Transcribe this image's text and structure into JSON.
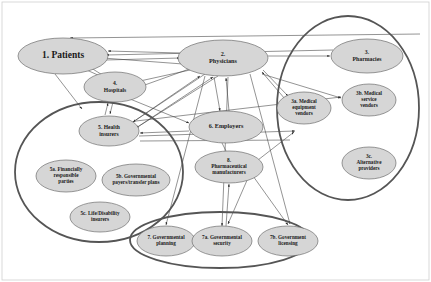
{
  "diagram": {
    "colors": {
      "node_fill": "#d6d6d6",
      "node_stroke": "#6e6e6e",
      "cluster_stroke": "#555555",
      "edge_stroke": "#3b3b3b",
      "background": "#ffffff",
      "frame_stroke": "#cfcfcf"
    },
    "clusters": [
      {
        "id": "cluster-insurers",
        "cx": 99,
        "cy": 172,
        "rx": 84,
        "ry": 70
      },
      {
        "id": "cluster-vendors",
        "cx": 348,
        "cy": 108,
        "rx": 71,
        "ry": 92
      },
      {
        "id": "cluster-government",
        "cx": 220,
        "cy": 240,
        "rx": 90,
        "ry": 28
      }
    ],
    "nodes": [
      {
        "id": "patients",
        "label_lines": [
          "1. Patients"
        ],
        "cx": 63,
        "cy": 56,
        "rx": 45,
        "ry": 18,
        "font_size": 9.5,
        "bold": true
      },
      {
        "id": "physicians",
        "label_lines": [
          "2.",
          "Physicians"
        ],
        "cx": 223,
        "cy": 58,
        "rx": 45,
        "ry": 18,
        "font_size": 6.2,
        "bold": true
      },
      {
        "id": "pharmacies",
        "label_lines": [
          "3.",
          "Pharmacies"
        ],
        "cx": 367,
        "cy": 56,
        "rx": 36,
        "ry": 17,
        "font_size": 5.8,
        "bold": true
      },
      {
        "id": "hospitals",
        "label_lines": [
          "4.",
          "Hospitals"
        ],
        "cx": 115,
        "cy": 87,
        "rx": 31,
        "ry": 15,
        "font_size": 5.6,
        "bold": true
      },
      {
        "id": "health-insurers",
        "label_lines": [
          "5. Health",
          "insurers"
        ],
        "cx": 109,
        "cy": 131,
        "rx": 30,
        "ry": 15,
        "font_size": 5.6,
        "bold": true
      },
      {
        "id": "employers",
        "label_lines": [
          "6. Employers"
        ],
        "cx": 226,
        "cy": 127,
        "rx": 37,
        "ry": 16,
        "font_size": 6.2,
        "bold": true
      },
      {
        "id": "pharma-manufacturers",
        "label_lines": [
          "8.",
          "Pharmaceutical",
          "manufacturers"
        ],
        "cx": 229,
        "cy": 167,
        "rx": 34,
        "ry": 16,
        "font_size": 5.3,
        "bold": true
      },
      {
        "id": "medical-equipment-vendors",
        "label_lines": [
          "3a. Medical",
          "equipment",
          "vendors"
        ],
        "cx": 304,
        "cy": 108,
        "rx": 27,
        "ry": 16,
        "font_size": 5.2,
        "bold": true
      },
      {
        "id": "medical-service-vendors",
        "label_lines": [
          "3b. Medical",
          "service",
          "vendors"
        ],
        "cx": 369,
        "cy": 100,
        "rx": 27,
        "ry": 16,
        "font_size": 5.2,
        "bold": true
      },
      {
        "id": "alternative-providers",
        "label_lines": [
          "3c.",
          "Alternative",
          "providers"
        ],
        "cx": 369,
        "cy": 163,
        "rx": 27,
        "ry": 16,
        "font_size": 5.2,
        "bold": true
      },
      {
        "id": "financially-responsible-parties",
        "label_lines": [
          "5a. Financially",
          "responsible",
          "parties"
        ],
        "cx": 66,
        "cy": 176,
        "rx": 30,
        "ry": 16,
        "font_size": 5.2,
        "bold": true
      },
      {
        "id": "governmental-payers",
        "label_lines": [
          "5b. Governmental",
          "payers/transfer plans"
        ],
        "cx": 136,
        "cy": 180,
        "rx": 34,
        "ry": 16,
        "font_size": 5.2,
        "bold": true
      },
      {
        "id": "life-disability-insurers",
        "label_lines": [
          "5c. Life/Disability",
          "insurers"
        ],
        "cx": 100,
        "cy": 217,
        "rx": 30,
        "ry": 15,
        "font_size": 5.2,
        "bold": true
      },
      {
        "id": "governmental-planning",
        "label_lines": [
          "7. Governmental",
          "planning"
        ],
        "cx": 166,
        "cy": 241,
        "rx": 29,
        "ry": 15,
        "font_size": 5.2,
        "bold": true
      },
      {
        "id": "governmental-security",
        "label_lines": [
          "7a. Governmental",
          "security"
        ],
        "cx": 222,
        "cy": 241,
        "rx": 30,
        "ry": 15,
        "font_size": 5.2,
        "bold": true
      },
      {
        "id": "governmental-licensing",
        "label_lines": [
          "7b. Government",
          "licensing"
        ],
        "cx": 288,
        "cy": 241,
        "rx": 30,
        "ry": 15,
        "font_size": 5.2,
        "bold": true
      }
    ],
    "edges": [
      {
        "id": "edge-patients-physicians-top",
        "x1": 70,
        "y1": 38,
        "x2": 420,
        "y2": 34,
        "arrow": "start"
      },
      {
        "id": "edge-physicians-patients-1",
        "x1": 180,
        "y1": 53,
        "x2": 108,
        "y2": 51,
        "arrow": "end"
      },
      {
        "id": "edge-physicians-patients-2",
        "x1": 183,
        "y1": 64,
        "x2": 103,
        "y2": 58,
        "arrow": "end"
      },
      {
        "id": "edge-pharmacies-patients",
        "x1": 333,
        "y1": 50,
        "x2": 106,
        "y2": 55,
        "arrow": "end"
      },
      {
        "id": "edge-patients-physicians-mid",
        "x1": 106,
        "y1": 60,
        "x2": 180,
        "y2": 58,
        "arrow": "end"
      },
      {
        "id": "edge-hospitals-patients",
        "x1": 100,
        "y1": 76,
        "x2": 80,
        "y2": 67,
        "arrow": "end"
      },
      {
        "id": "edge-patients-hospitals",
        "x1": 88,
        "y1": 66,
        "x2": 104,
        "y2": 76,
        "arrow": "end"
      },
      {
        "id": "edge-patients-insurers-left",
        "x1": 55,
        "y1": 74,
        "x2": 82,
        "y2": 109,
        "arrow": "end"
      },
      {
        "id": "edge-hospitals-insurers",
        "x1": 113,
        "y1": 102,
        "x2": 110,
        "y2": 114,
        "arrow": "end"
      },
      {
        "id": "edge-insurers-hospitals",
        "x1": 105,
        "y1": 115,
        "x2": 108,
        "y2": 103,
        "arrow": "end"
      },
      {
        "id": "edge-physicians-hospitals",
        "x1": 190,
        "y1": 70,
        "x2": 140,
        "y2": 81,
        "arrow": "end"
      },
      {
        "id": "edge-hospitals-physicians",
        "x1": 142,
        "y1": 86,
        "x2": 192,
        "y2": 68,
        "arrow": "end"
      },
      {
        "id": "edge-insurers-physicians-1",
        "x1": 130,
        "y1": 124,
        "x2": 200,
        "y2": 76,
        "arrow": "end"
      },
      {
        "id": "edge-insurers-physicians-2",
        "x1": 133,
        "y1": 130,
        "x2": 213,
        "y2": 77,
        "arrow": "end"
      },
      {
        "id": "edge-physicians-insurers-1",
        "x1": 205,
        "y1": 74,
        "x2": 133,
        "y2": 122,
        "arrow": "end"
      },
      {
        "id": "edge-physicians-insurers-2",
        "x1": 218,
        "y1": 76,
        "x2": 136,
        "y2": 128,
        "arrow": "end"
      },
      {
        "id": "edge-employers-insurers",
        "x1": 189,
        "y1": 131,
        "x2": 140,
        "y2": 133,
        "arrow": "end"
      },
      {
        "id": "edge-insurers-employers",
        "x1": 140,
        "y1": 141,
        "x2": 290,
        "y2": 140,
        "arrow": "none"
      },
      {
        "id": "edge-physicians-employers",
        "x1": 214,
        "y1": 77,
        "x2": 220,
        "y2": 111,
        "arrow": "end"
      },
      {
        "id": "edge-employers-physicians",
        "x1": 229,
        "y1": 111,
        "x2": 226,
        "y2": 78,
        "arrow": "end"
      },
      {
        "id": "edge-patients-employers",
        "x1": 108,
        "y1": 90,
        "x2": 189,
        "y2": 123,
        "arrow": "end"
      },
      {
        "id": "edge-employers-pharma",
        "x1": 222,
        "y1": 143,
        "x2": 226,
        "y2": 151,
        "arrow": "none"
      },
      {
        "id": "edge-physicians-pharmacies",
        "x1": 268,
        "y1": 56,
        "x2": 330,
        "y2": 56,
        "arrow": "end"
      },
      {
        "id": "edge-physicians-equipment",
        "x1": 263,
        "y1": 70,
        "x2": 288,
        "y2": 96,
        "arrow": "end"
      },
      {
        "id": "edge-physicians-servicevendors",
        "x1": 262,
        "y1": 74,
        "x2": 341,
        "y2": 98,
        "arrow": "end"
      },
      {
        "id": "edge-insurers-servicevendors",
        "x1": 136,
        "y1": 121,
        "x2": 341,
        "y2": 97,
        "arrow": "end"
      },
      {
        "id": "edge-pharma-vendors",
        "x1": 258,
        "y1": 160,
        "x2": 294,
        "y2": 132,
        "arrow": "end"
      },
      {
        "id": "edge-insurers-vendors-low",
        "x1": 139,
        "y1": 136,
        "x2": 295,
        "y2": 131,
        "arrow": "end"
      },
      {
        "id": "edge-physicians-planning",
        "x1": 205,
        "y1": 76,
        "x2": 166,
        "y2": 225,
        "arrow": "end"
      },
      {
        "id": "edge-physicians-security",
        "x1": 228,
        "y1": 77,
        "x2": 222,
        "y2": 226,
        "arrow": "end"
      },
      {
        "id": "edge-security-pharma",
        "x1": 226,
        "y1": 226,
        "x2": 229,
        "y2": 184,
        "arrow": "end"
      },
      {
        "id": "edge-pharma-security",
        "x1": 248,
        "y1": 178,
        "x2": 228,
        "y2": 224,
        "arrow": "end"
      },
      {
        "id": "edge-pharma-licensing",
        "x1": 253,
        "y1": 176,
        "x2": 288,
        "y2": 225,
        "arrow": "end"
      },
      {
        "id": "edge-physicians-licensing",
        "x1": 250,
        "y1": 74,
        "x2": 290,
        "y2": 224,
        "arrow": "end"
      },
      {
        "id": "edge-equipment-physicians",
        "x1": 285,
        "y1": 99,
        "x2": 262,
        "y2": 72,
        "arrow": "end"
      }
    ]
  }
}
